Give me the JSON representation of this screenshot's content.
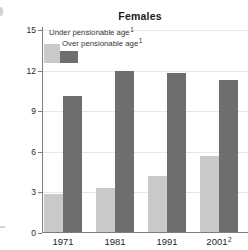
{
  "chart_data": {
    "type": "bar",
    "title": "Females",
    "categories": [
      {
        "label": "1971",
        "sup": ""
      },
      {
        "label": "1981",
        "sup": ""
      },
      {
        "label": "1991",
        "sup": ""
      },
      {
        "label": "2001",
        "sup": "2"
      }
    ],
    "series": [
      {
        "name": "Under pensionable age",
        "name_sup": "1",
        "color": "#c8c9c8",
        "values": [
          2.9,
          3.3,
          4.2,
          5.7
        ]
      },
      {
        "name": "Over pensionable age",
        "name_sup": "1",
        "color": "#6e6e6e",
        "values": [
          10.1,
          12.0,
          11.8,
          11.3
        ]
      }
    ],
    "ylim": [
      0,
      15
    ],
    "yticks": [
      0,
      3,
      6,
      9,
      12,
      15
    ],
    "grid": "horizontal",
    "legend_position": "top-left-inside",
    "colors": {
      "under_bar": "#c8c9c8",
      "over_bar": "#6e6e6e",
      "gridline": "#e7e7e7",
      "axis": "#7d7d7d",
      "text": "#262626"
    }
  }
}
